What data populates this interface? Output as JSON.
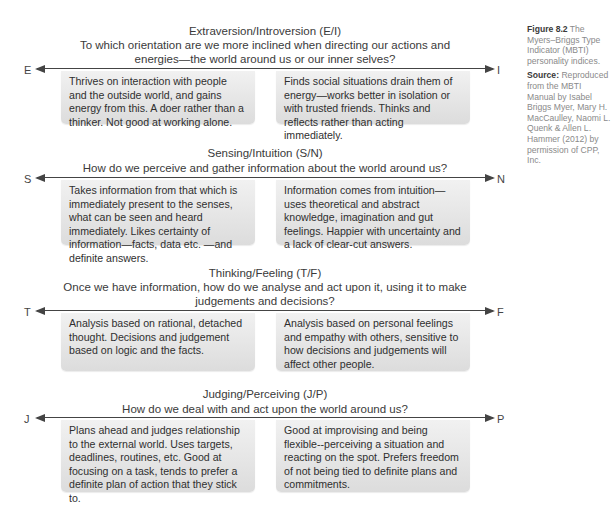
{
  "caption": {
    "figure_number": "Figure 8.2",
    "figure_title": "The Myers–Briggs Type Indicator (MBTI) personality indices.",
    "source_label": "Source:",
    "source_text": "Reproduced from the MBTI Manual by Isabel Briggs Myer, Mary H. MacCaulley, Naomi L. Quenk & Allen L. Hammer (2012) by permission of CPP, Inc."
  },
  "dimensions": [
    {
      "title": "Extraversion/Introversion (E/I)",
      "question_lines": [
        "To which orientation are we more inclined when directing our actions and",
        "energies—the world around us or our inner selves?"
      ],
      "left_pole": "E",
      "right_pole": "I",
      "left_text": "Thrives on interaction with people and the outside world, and gains energy from this. A doer rather than a thinker. Not good at working alone.",
      "right_text": "Finds social situations drain them of energy—works better in isolation or with trusted friends. Thinks and reflects rather than acting immediately."
    },
    {
      "title": "Sensing/Intuition (S/N)",
      "question_lines": [
        "How do we perceive and gather information about the world around us?"
      ],
      "left_pole": "S",
      "right_pole": "N",
      "left_text": "Takes information from that which is immediately present to the senses, what can be seen and heard immediately. Likes certainty of information—facts, data etc. —and definite answers.",
      "right_text": "Information comes from intuition—uses theoretical and abstract knowledge, imagination and gut feelings. Happier with uncertainty and a lack of clear-cut answers."
    },
    {
      "title": "Thinking/Feeling (T/F)",
      "question_lines": [
        "Once we have information, how do we analyse and act upon it, using it to make",
        "judgements and decisions?"
      ],
      "left_pole": "T",
      "right_pole": "F",
      "left_text": "Analysis based on rational, detached thought. Decisions and judgement based on logic and the facts.",
      "right_text": "Analysis based on personal feelings and empathy with others, sensitive to how decisions and judgements will affect other people."
    },
    {
      "title": "Judging/Perceiving (J/P)",
      "question_lines": [
        "How do we deal with and act upon the world around us?"
      ],
      "left_pole": "J",
      "right_pole": "P",
      "left_text": "Plans ahead and judges relationship to the external world. Uses targets, deadlines, routines, etc. Good at focusing on a task, tends to prefer a definite plan of action that they stick to.",
      "right_text": "Good at improvising and being flexible--perceiving a situation and reacting on the spot. Prefers freedom of not being tied to definite plans and commitments."
    }
  ]
}
